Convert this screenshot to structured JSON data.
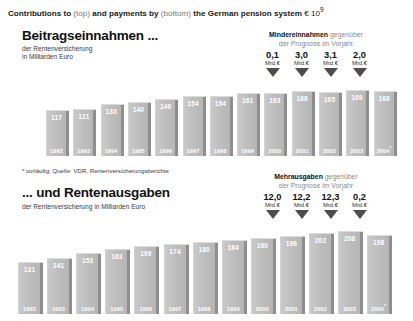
{
  "headline": {
    "part1": "Contributions to ",
    "light1": "(top)",
    "part2": " and payments by ",
    "light2": "(bottom)",
    "part3": " the German pension system ",
    "currency": "€ 10",
    "exponent": "9"
  },
  "top_section": {
    "title": "Beitragseinnahmen ...",
    "subtitle_line1": "der Rentenversicherung",
    "subtitle_line2": "in Milliarden Euro"
  },
  "bottom_section": {
    "title": "... und Rentenausgaben",
    "subtitle_line1": "der Rentenversicherung in Milliarden Euro"
  },
  "source_note": "* vorläufig; Quelle: VDR, Rentenversicherungsberichte",
  "annotation_top": {
    "head_bold": "Mindereinnahmen",
    "head_light": " gegenüber",
    "line2": "der Prognose im Vorjahr",
    "unit": "Mrd.€",
    "values": [
      "0,1",
      "3,0",
      "3,1",
      "2,0"
    ],
    "arrow_icon": "arrow-down-icon"
  },
  "annotation_bottom": {
    "head_bold": "Mehrausgaben",
    "head_light": " gegenüber",
    "line2": "der Prognose im Vorjahr",
    "unit": "Mrd.€",
    "values": [
      "12,0",
      "12,2",
      "12,3",
      "0,2"
    ],
    "arrow_icon": "arrow-down-icon"
  },
  "chart_data": [
    {
      "type": "bar",
      "title": "Beitragseinnahmen ...",
      "subtitle": "der Rentenversicherung in Milliarden Euro",
      "xlabel": "",
      "ylabel": "Milliarden Euro",
      "ylim": [
        0,
        180
      ],
      "grid": false,
      "legend": "none",
      "categories": [
        "1992",
        "1993",
        "1994",
        "1995",
        "1996",
        "1997",
        "1998",
        "1999",
        "2000",
        "2001",
        "2002",
        "2003",
        "2004"
      ],
      "values": [
        117,
        121,
        133,
        140,
        146,
        154,
        154,
        161,
        163,
        166,
        165,
        169,
        168
      ],
      "last_category_provisional": true
    },
    {
      "type": "bar",
      "title": "... und Rentenausgaben",
      "subtitle": "der Rentenversicherung in Milliarden Euro",
      "xlabel": "",
      "ylabel": "Milliarden Euro",
      "ylim": [
        0,
        220
      ],
      "grid": false,
      "legend": "none",
      "categories": [
        "1992",
        "1993",
        "1994",
        "1995",
        "1996",
        "1997",
        "1998",
        "1999",
        "2000",
        "2001",
        "2002",
        "2003",
        "2004"
      ],
      "values": [
        131,
        141,
        153,
        163,
        169,
        174,
        180,
        184,
        190,
        196,
        202,
        208,
        198
      ],
      "last_category_provisional": true
    }
  ]
}
